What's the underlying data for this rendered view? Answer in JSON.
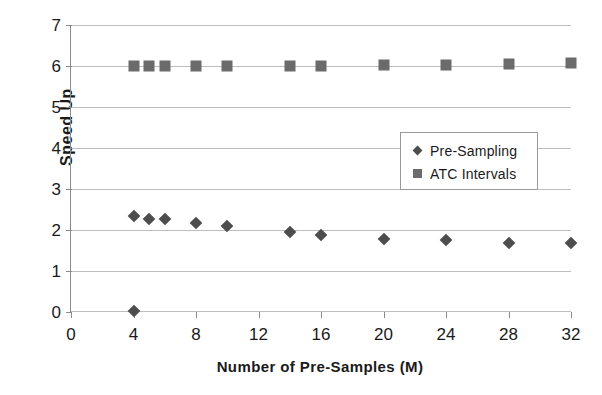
{
  "chart_data": {
    "type": "scatter",
    "title": "",
    "xlabel": "Number of Pre-Samples (M)",
    "ylabel": "Speed Up",
    "xlim": [
      0,
      32
    ],
    "ylim": [
      0,
      7
    ],
    "xticks": [
      0,
      4,
      8,
      12,
      16,
      20,
      24,
      28,
      32
    ],
    "yticks": [
      0,
      1,
      2,
      3,
      4,
      5,
      6,
      7
    ],
    "grid": "horizontal",
    "legend_position": "center-right",
    "series": [
      {
        "name": "Pre-Sampling",
        "marker": "diamond",
        "color": "#4d4d4d",
        "x": [
          4,
          4,
          5,
          6,
          8,
          10,
          14,
          16,
          20,
          24,
          28,
          32
        ],
        "values": [
          0.03,
          2.35,
          2.27,
          2.27,
          2.17,
          2.1,
          1.95,
          1.88,
          1.78,
          1.75,
          1.68,
          1.68
        ]
      },
      {
        "name": "ATC Intervals",
        "marker": "square",
        "color": "#6b6b6b",
        "x": [
          4,
          5,
          6,
          8,
          10,
          14,
          16,
          20,
          24,
          28,
          32
        ],
        "values": [
          6.0,
          6.0,
          6.0,
          6.0,
          6.0,
          6.0,
          6.0,
          6.03,
          6.03,
          6.05,
          6.07
        ]
      }
    ]
  },
  "legend": {
    "entries": [
      {
        "label": "Pre-Sampling",
        "marker": "diamond-icon"
      },
      {
        "label": "ATC Intervals",
        "marker": "square-icon"
      }
    ]
  }
}
